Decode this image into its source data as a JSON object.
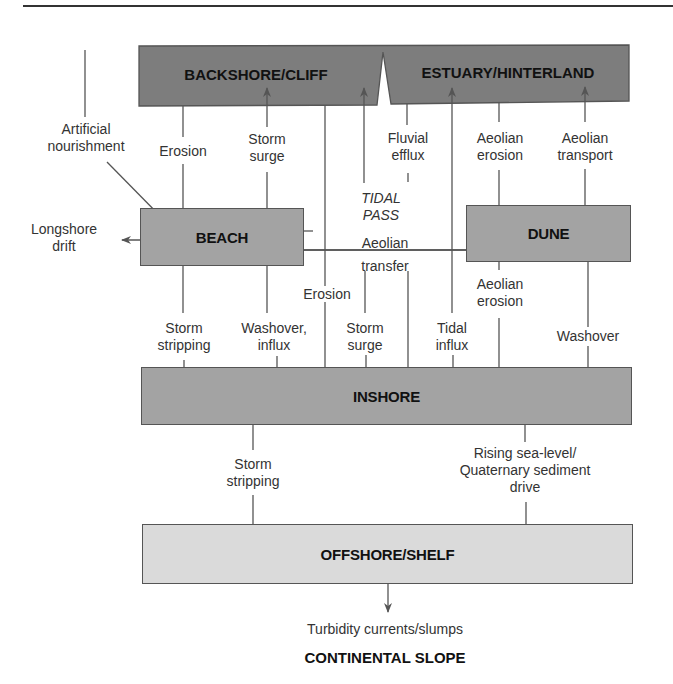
{
  "diagram": {
    "compartments": {
      "backshore": "BACKSHORE/CLIFF",
      "estuary": "ESTUARY/HINTERLAND",
      "beach": "BEACH",
      "dune": "DUNE",
      "inshore": "INSHORE",
      "offshore": "OFFSHORE/SHELF",
      "continental_slope": "CONTINENTAL SLOPE"
    },
    "flows": {
      "artificial_nourishment": [
        "Artificial",
        "nourishment"
      ],
      "erosion_backshore_beach": "Erosion",
      "storm_surge_beach_backshore": [
        "Storm",
        "surge"
      ],
      "fluvial_efflux": [
        "Fluvial",
        "efflux"
      ],
      "aeolian_erosion_estuary_dune": [
        "Aeolian",
        "erosion"
      ],
      "aeolian_transport": [
        "Aeolian",
        "transport"
      ],
      "tidal_pass": [
        "TIDAL",
        "PASS"
      ],
      "longshore_drift": [
        "Longshore",
        "drift"
      ],
      "aeolian_transfer": [
        "Aeolian",
        "transfer"
      ],
      "erosion_backshore_inshore": "Erosion",
      "aeolian_erosion_dune_inshore": [
        "Aeolian",
        "erosion"
      ],
      "storm_stripping_beach_inshore": [
        "Storm",
        "stripping"
      ],
      "washover_influx": [
        "Washover,",
        "influx"
      ],
      "storm_surge_inshore": [
        "Storm",
        "surge"
      ],
      "tidal_influx": [
        "Tidal",
        "influx"
      ],
      "washover_dune": "Washover",
      "storm_stripping_inshore_offshore": [
        "Storm",
        "stripping"
      ],
      "rising_sea_level": [
        "Rising sea-level/",
        "Quaternary sediment",
        "drive"
      ],
      "turbidity_currents": "Turbidity currents/slumps"
    },
    "colors": {
      "dark_box": "#7d7d7d",
      "mid_box": "#a3a3a3",
      "light_box": "#dadada",
      "line": "#555555"
    }
  }
}
